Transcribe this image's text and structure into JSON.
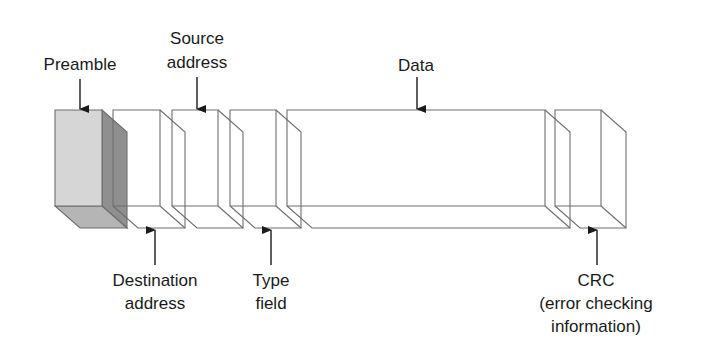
{
  "diagram": {
    "box_top": 110,
    "box_bottom": 206,
    "depth_dx": 25,
    "depth_dy": 22,
    "colors": {
      "stroke": "#6e6e6e",
      "text": "#1a1a1a",
      "preamble_front": "#d6d6d6",
      "preamble_side": "#8f8f8f",
      "preamble_bottom": "#b5b5b5"
    },
    "fields": [
      {
        "id": "preamble",
        "x0": 55,
        "x1": 102,
        "shaded": true
      },
      {
        "id": "destination-address",
        "x0": 113,
        "x1": 160,
        "shaded": false
      },
      {
        "id": "source-address",
        "x0": 172,
        "x1": 218,
        "shaded": false
      },
      {
        "id": "type-field",
        "x0": 230,
        "x1": 276,
        "shaded": false
      },
      {
        "id": "data",
        "x0": 287,
        "x1": 545,
        "shaded": false
      },
      {
        "id": "crc",
        "x0": 555,
        "x1": 601,
        "shaded": false
      }
    ],
    "labels": [
      {
        "id": "preamble",
        "position": "top",
        "lines": [
          "Preamble"
        ],
        "cx": 80,
        "arrow_x": 80,
        "text_y": [
          70
        ],
        "arrow_from": 79,
        "arrow_to": 109
      },
      {
        "id": "source-address",
        "position": "top",
        "lines": [
          "Source",
          "address"
        ],
        "cx": 197,
        "arrow_x": 197,
        "text_y": [
          44,
          68
        ],
        "arrow_from": 77,
        "arrow_to": 109
      },
      {
        "id": "data",
        "position": "top",
        "lines": [
          "Data"
        ],
        "cx": 416,
        "arrow_x": 417,
        "text_y": [
          71
        ],
        "arrow_from": 77,
        "arrow_to": 109
      },
      {
        "id": "destination-address",
        "position": "bottom",
        "lines": [
          "Destination",
          "address"
        ],
        "cx": 155,
        "arrow_x": 155,
        "text_y": [
          286,
          309
        ],
        "arrow_from": 265,
        "arrow_to": 230
      },
      {
        "id": "type-field",
        "position": "bottom",
        "lines": [
          "Type",
          "field"
        ],
        "cx": 271,
        "arrow_x": 271,
        "text_y": [
          286,
          309
        ],
        "arrow_from": 265,
        "arrow_to": 230
      },
      {
        "id": "crc",
        "position": "bottom",
        "lines": [
          "CRC",
          "(error checking",
          "information)"
        ],
        "cx": 596,
        "arrow_x": 597,
        "text_y": [
          286,
          309,
          332
        ],
        "arrow_from": 265,
        "arrow_to": 230
      }
    ]
  }
}
